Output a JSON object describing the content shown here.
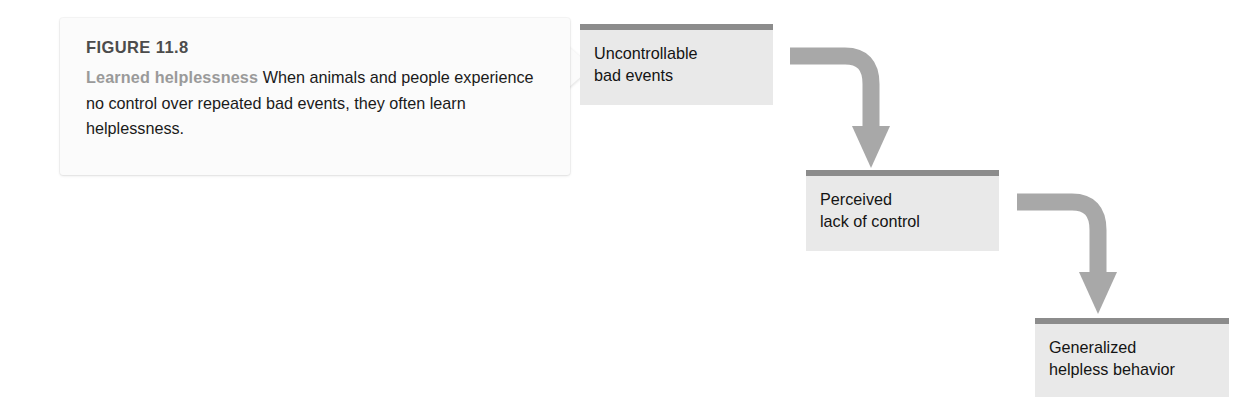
{
  "figure": {
    "caption": {
      "figure_label": "FIGURE 11.8",
      "lead_in": "Learned helplessness",
      "body_text": "When animals and people experience no control over repeated bad events, they often learn helplessness.",
      "lead_color": "#9a9a9a",
      "label_color": "#4c4c4c",
      "body_color": "#1a1a1a",
      "background_color": "#fbfbfb"
    },
    "colors": {
      "box_fill": "#e9e9e9",
      "box_top_bar": "#8c8c8c",
      "arrow": "#a8a8a8",
      "page_background": "#ffffff"
    },
    "flow": {
      "boxes": [
        {
          "id": "uncontrollable-bad-events",
          "label": "Uncontrollable\nbad events"
        },
        {
          "id": "perceived-lack-of-control",
          "label": "Perceived\nlack of control"
        },
        {
          "id": "generalized-helpless-behavior",
          "label": "Generalized\nhelpless behavior"
        }
      ],
      "arrows": [
        {
          "id": "arrow-1",
          "from": "uncontrollable-bad-events",
          "to": "perceived-lack-of-control",
          "direction": "right-then-down"
        },
        {
          "id": "arrow-2",
          "from": "perceived-lack-of-control",
          "to": "generalized-helpless-behavior",
          "direction": "right-then-down"
        }
      ]
    }
  }
}
